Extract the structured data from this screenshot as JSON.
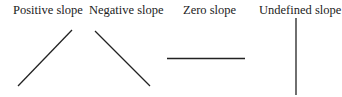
{
  "diagram": {
    "panels": [
      {
        "label": "Positive slope",
        "line": {
          "x1": 18,
          "y1": 86,
          "x2": 72,
          "y2": 30
        }
      },
      {
        "label": "Negative slope",
        "line": {
          "x1": 95,
          "y1": 31,
          "x2": 150,
          "y2": 86
        }
      },
      {
        "label": "Zero slope",
        "line": {
          "x1": 167,
          "y1": 58.5,
          "x2": 245,
          "y2": 58.5
        }
      },
      {
        "label": "Undefined slope",
        "line": {
          "x1": 296,
          "y1": 18,
          "x2": 296,
          "y2": 95
        }
      }
    ],
    "line_color": "#222222"
  }
}
